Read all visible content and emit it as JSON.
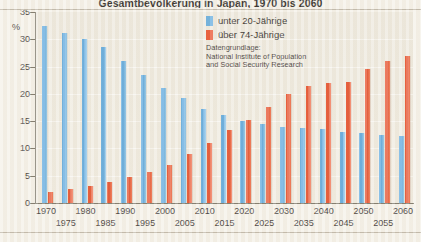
{
  "chart_data": {
    "type": "bar",
    "title": "Gesamtbevölkerung in Japan, 1970 bis 2060",
    "xlabel": "",
    "ylabel": "%",
    "ylim": [
      0,
      35
    ],
    "yticks": [
      0,
      5,
      10,
      15,
      20,
      25,
      30,
      35
    ],
    "grid": true,
    "legend_position": "top-center",
    "categories": [
      "1970",
      "1975",
      "1980",
      "1985",
      "1990",
      "1995",
      "2000",
      "2005",
      "2010",
      "2015",
      "2020",
      "2025",
      "2030",
      "2035",
      "2040",
      "2045",
      "2050",
      "2055",
      "2060"
    ],
    "series": [
      {
        "name": "unter 20-Jährige",
        "color": "#59a6dc",
        "values": [
          32.5,
          31.2,
          30.0,
          28.5,
          26.0,
          23.5,
          21.0,
          19.3,
          17.2,
          16.1,
          15.1,
          14.5,
          14.0,
          13.8,
          13.5,
          13.1,
          12.8,
          12.5,
          12.3
        ]
      },
      {
        "name": "über 74-Jährige",
        "color": "#e8431c",
        "values": [
          2.0,
          2.5,
          3.1,
          3.9,
          4.7,
          5.6,
          6.9,
          9.0,
          11.0,
          13.4,
          15.3,
          17.6,
          19.9,
          21.4,
          22.0,
          22.1,
          24.5,
          26.0,
          27.0
        ]
      }
    ],
    "annotation": "Datengrundlage:\nNational Institute of Population\nand Social Security Research"
  },
  "legend": {
    "items": [
      {
        "label": "unter 20-Jährige"
      },
      {
        "label": "über 74-Jährige"
      }
    ]
  }
}
